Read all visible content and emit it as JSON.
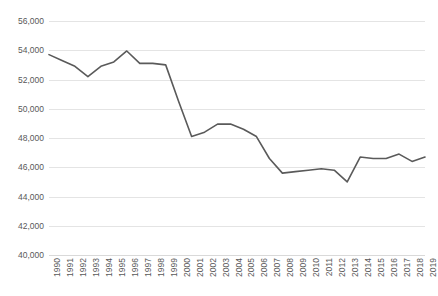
{
  "chart_data": {
    "type": "line",
    "title": "",
    "subtitle": "",
    "xlabel": "",
    "ylabel": "",
    "categories": [
      "1990",
      "1991",
      "1992",
      "1993",
      "1994",
      "1995",
      "1996",
      "1997",
      "1998",
      "1999",
      "2000",
      "2001",
      "2002",
      "2003",
      "2004",
      "2005",
      "2006",
      "2007",
      "2008",
      "2009",
      "2010",
      "2011",
      "2012",
      "2013",
      "2014",
      "2015",
      "2016",
      "2017",
      "2018",
      "2019"
    ],
    "values": [
      53700,
      53300,
      52900,
      52200,
      52900,
      53200,
      53950,
      53100,
      53100,
      53000,
      50500,
      48100,
      48400,
      48950,
      48950,
      48600,
      48100,
      46600,
      45600,
      45700,
      45800,
      45900,
      45800,
      45000,
      46700,
      46600,
      46600,
      46900,
      46400,
      46700
    ],
    "series": [
      {
        "name": "series-1",
        "values": [
          53700,
          53300,
          52900,
          52200,
          52900,
          53200,
          53950,
          53100,
          53100,
          53000,
          50500,
          48100,
          48400,
          48950,
          48950,
          48600,
          48100,
          46600,
          45600,
          45700,
          45800,
          45900,
          45800,
          45000,
          46700,
          46600,
          46600,
          46900,
          46400,
          46700
        ],
        "color": "#5a5a5a"
      }
    ],
    "ylim": [
      40000,
      56000
    ],
    "ytick_values": [
      40000,
      42000,
      44000,
      46000,
      48000,
      50000,
      52000,
      54000,
      56000
    ],
    "ytick_labels": [
      "40,000",
      "42,000",
      "44,000",
      "46,000",
      "48,000",
      "50,000",
      "52,000",
      "54,000",
      "56,000"
    ],
    "xtick_labels": [
      "1990",
      "1991",
      "1992",
      "1993",
      "1994",
      "1995",
      "1996",
      "1997",
      "1998",
      "1999",
      "2000",
      "2001",
      "2002",
      "2003",
      "2004",
      "2005",
      "2006",
      "2007",
      "2008",
      "2009",
      "2010",
      "2011",
      "2012",
      "2013",
      "2014",
      "2015",
      "2016",
      "2017",
      "2018",
      "2019"
    ],
    "grid": true,
    "grid_axis": "y",
    "grid_color": "#e4e4e4",
    "legend": false,
    "legend_position": "none",
    "line_color": "#5a5a5a",
    "line_width": 1.6,
    "markers": false,
    "background_color": "#ffffff",
    "axis_label_color": "#595959",
    "xtick_rotation": -90,
    "annotations": []
  }
}
